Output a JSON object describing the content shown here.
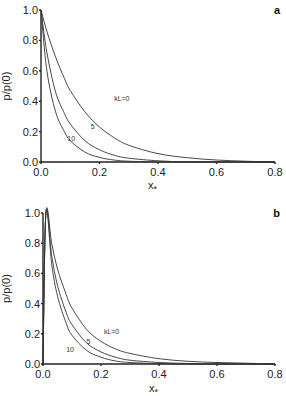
{
  "chart_data": [
    {
      "type": "line",
      "panel": "a",
      "title": "",
      "xlabel": "x*",
      "ylabel": "p/p(0)",
      "xlim": [
        0.0,
        0.8
      ],
      "ylim": [
        0.0,
        1.0
      ],
      "xticks": [
        "0.0",
        "0.2",
        "0.4",
        "0.6",
        "0.8"
      ],
      "yticks": [
        "0.0",
        "0.2",
        "0.4",
        "0.6",
        "0.8",
        "1.0"
      ],
      "grid": false,
      "legend": "inline curve labels",
      "x": [
        0.0,
        0.02,
        0.05,
        0.08,
        0.1,
        0.15,
        0.2,
        0.25,
        0.3,
        0.4,
        0.5,
        0.6,
        0.7,
        0.8
      ],
      "series": [
        {
          "name": "kL=0",
          "label": "kL=0",
          "values": [
            1.0,
            0.86,
            0.69,
            0.55,
            0.47,
            0.33,
            0.23,
            0.16,
            0.11,
            0.055,
            0.028,
            0.013,
            0.005,
            0.0
          ]
        },
        {
          "name": "5",
          "label": "5",
          "values": [
            1.0,
            0.72,
            0.46,
            0.32,
            0.25,
            0.14,
            0.08,
            0.045,
            0.025,
            0.008,
            0.0,
            0.0,
            0.0,
            0.0
          ]
        },
        {
          "name": "10",
          "label": "10",
          "values": [
            1.0,
            0.6,
            0.33,
            0.2,
            0.14,
            0.065,
            0.03,
            0.013,
            0.005,
            0.0,
            0.0,
            0.0,
            0.0,
            0.0
          ]
        }
      ],
      "annotations": [
        {
          "text": "kL=0",
          "x": 0.25,
          "y": 0.4
        },
        {
          "text": "5",
          "x": 0.17,
          "y": 0.22
        },
        {
          "text": "10",
          "x": 0.09,
          "y": 0.14
        }
      ]
    },
    {
      "type": "line",
      "panel": "b",
      "title": "",
      "xlabel": "x*",
      "ylabel": "p/p(0)",
      "xlim": [
        0.0,
        0.8
      ],
      "ylim": [
        0.0,
        1.0
      ],
      "xticks": [
        "0.0",
        "0.2",
        "0.4",
        "0.6",
        "0.8"
      ],
      "yticks": [
        "0.0",
        "0.2",
        "0.4",
        "0.6",
        "0.8",
        "1.0"
      ],
      "grid": false,
      "legend": "inline curve labels",
      "x": [
        0.0,
        0.01,
        0.03,
        0.05,
        0.08,
        0.1,
        0.15,
        0.2,
        0.25,
        0.3,
        0.4,
        0.5,
        0.6,
        0.7,
        0.8
      ],
      "series": [
        {
          "name": "kL=0",
          "label": "kL=0",
          "values": [
            0.0,
            1.0,
            0.8,
            0.63,
            0.46,
            0.37,
            0.23,
            0.15,
            0.1,
            0.07,
            0.035,
            0.018,
            0.01,
            0.005,
            0.0
          ]
        },
        {
          "name": "5",
          "label": "5",
          "values": [
            0.0,
            1.0,
            0.72,
            0.52,
            0.34,
            0.26,
            0.14,
            0.08,
            0.045,
            0.025,
            0.01,
            0.003,
            0.0,
            0.0,
            0.0
          ]
        },
        {
          "name": "10",
          "label": "10",
          "values": [
            0.0,
            1.0,
            0.66,
            0.45,
            0.27,
            0.19,
            0.09,
            0.045,
            0.02,
            0.01,
            0.002,
            0.0,
            0.0,
            0.0,
            0.0
          ]
        }
      ],
      "annotations": [
        {
          "text": "kL=0",
          "x": 0.21,
          "y": 0.2
        },
        {
          "text": "5",
          "x": 0.15,
          "y": 0.13
        },
        {
          "text": "10",
          "x": 0.08,
          "y": 0.08
        }
      ]
    }
  ],
  "panels": {
    "a": {
      "label": "a",
      "ylabel": "p/p(0)",
      "xlabel_main": "x",
      "xlabel_sub": "*"
    },
    "b": {
      "label": "b",
      "ylabel": "p/p(0)",
      "xlabel_main": "x",
      "xlabel_sub": "*"
    }
  }
}
